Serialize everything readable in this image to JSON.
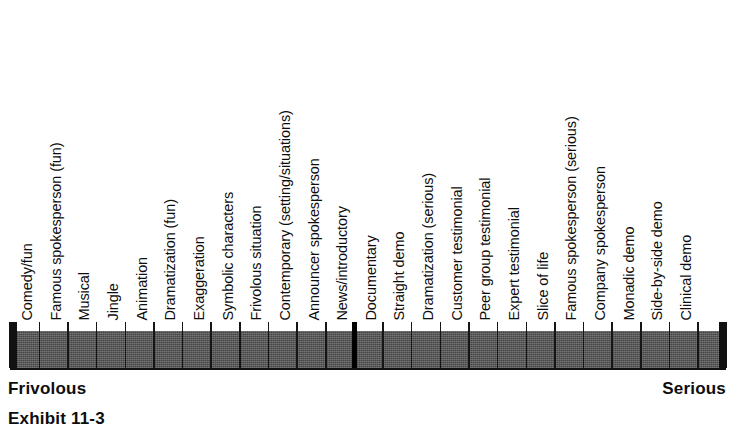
{
  "exhibit": {
    "caption": "Exhibit 11-3",
    "anchor_left": "Frivolous",
    "anchor_right": "Serious",
    "colors": {
      "bar_fill": "#585858",
      "bar_outline": "#111111",
      "text": "#0d0d0d",
      "background": "#ffffff"
    }
  },
  "chart_data": {
    "type": "bar",
    "title": "Exhibit 11-3",
    "subtitle": "",
    "xlabel": "",
    "ylabel": "",
    "orientation": "horizontal-scale",
    "grid": false,
    "legend": false,
    "axis_anchor_low": "Frivolous",
    "axis_anchor_high": "Serious",
    "major_divider_after_index": 10,
    "major_divider_label": "News/introductory",
    "categories": [
      "Comedy/fun",
      "Famous spokesperson (fun)",
      "Musical",
      "Jingle",
      "Animation",
      "Dramatization (fun)",
      "Exaggeration",
      "Symbolic characters",
      "Frivolous situation",
      "Contemporary (setting/situations)",
      "Announcer spokesperson",
      "News/introductory",
      "Documentary",
      "Straight demo",
      "Dramatization (serious)",
      "Customer testimonial",
      "Peer group testimonial",
      "Expert testimonial",
      "Slice of life",
      "Famous spokesperson (serious)",
      "Company spokesperson",
      "Monadic demo",
      "Side-by-side demo",
      "Clinical demo"
    ],
    "values": [
      1,
      2,
      3,
      4,
      5,
      6,
      7,
      8,
      9,
      10,
      11,
      12,
      13,
      14,
      15,
      16,
      17,
      18,
      19,
      20,
      21,
      22,
      23,
      24
    ],
    "xlim": [
      0,
      25
    ]
  }
}
